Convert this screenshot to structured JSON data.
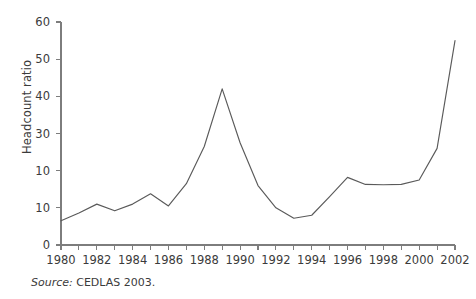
{
  "figure": {
    "source_note": {
      "label": "Source:",
      "text": "CEDLAS 2003."
    }
  },
  "chart_data": {
    "type": "line",
    "title": "",
    "xlabel": "",
    "ylabel": "Headcount ratio",
    "xlim": [
      1980,
      2002
    ],
    "ylim": [
      0,
      60
    ],
    "grid": false,
    "legend": null,
    "line_color": "#5a5a5a",
    "axis_color": "#7d7d7d",
    "y_ticks": [
      0,
      10,
      10,
      30,
      40,
      50,
      60
    ],
    "y_tick_labels": [
      "0",
      "10",
      "10",
      "30",
      "40",
      "50",
      "60"
    ],
    "y_tick_values": [
      0,
      10,
      20,
      30,
      40,
      50,
      60
    ],
    "y_tick_note": "The second label from the bottom is printed as '10' in the source image at the gridline position for 20.",
    "x_ticks_minor": [
      1980,
      1981,
      1982,
      1983,
      1984,
      1985,
      1986,
      1987,
      1988,
      1989,
      1990,
      1991,
      1992,
      1993,
      1994,
      1995,
      1996,
      1997,
      1998,
      1999,
      2000,
      2001,
      2002
    ],
    "x_tick_labels": [
      "1980",
      "1982",
      "1984",
      "1986",
      "1988",
      "1990",
      "1992",
      "1994",
      "1996",
      "1998",
      "2000",
      "2002"
    ],
    "x_tick_label_values": [
      1980,
      1982,
      1984,
      1986,
      1988,
      1990,
      1992,
      1994,
      1996,
      1998,
      2000,
      2002
    ],
    "x": [
      1980,
      1981,
      1982,
      1983,
      1984,
      1985,
      1986,
      1987,
      1988,
      1989,
      1990,
      1991,
      1992,
      1993,
      1994,
      1995,
      1996,
      1997,
      1998,
      1999,
      2000,
      2001,
      2002
    ],
    "values": [
      6.5,
      8.6,
      11.0,
      9.2,
      11.0,
      13.8,
      10.5,
      16.5,
      26.5,
      42.0,
      27.5,
      16.0,
      10.0,
      7.2,
      8.0,
      13.0,
      18.2,
      16.3,
      16.2,
      16.3,
      17.5,
      26.0,
      55.0
    ]
  }
}
